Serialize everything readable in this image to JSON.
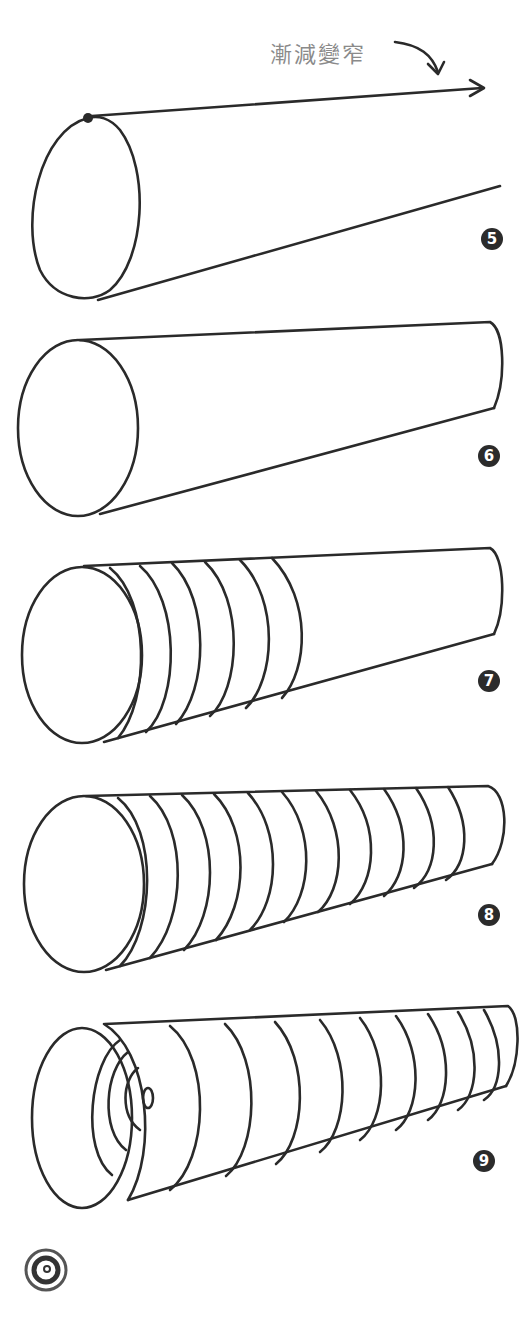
{
  "annotation": {
    "text": "漸減變窄"
  },
  "steps": [
    {
      "number": "5"
    },
    {
      "number": "6"
    },
    {
      "number": "7"
    },
    {
      "number": "8"
    },
    {
      "number": "9"
    }
  ]
}
